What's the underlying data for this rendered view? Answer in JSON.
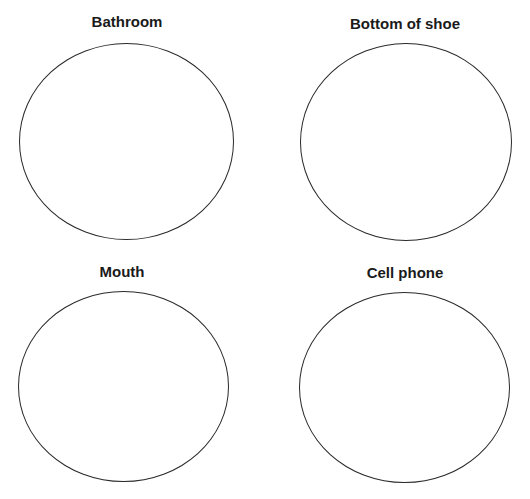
{
  "worksheet": {
    "panels": [
      {
        "label": "Bathroom"
      },
      {
        "label": "Bottom of shoe"
      },
      {
        "label": "Mouth"
      },
      {
        "label": "Cell phone"
      }
    ]
  }
}
